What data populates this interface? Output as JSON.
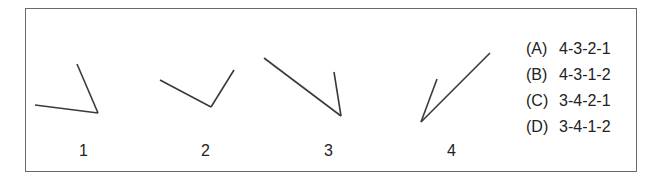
{
  "figures": [
    {
      "label": "1",
      "lines": [
        [
          35,
          105,
          98,
          113
        ],
        [
          98,
          113,
          77,
          64
        ]
      ]
    },
    {
      "label": "2",
      "lines": [
        [
          160,
          80,
          211,
          107
        ],
        [
          211,
          107,
          234,
          70
        ]
      ]
    },
    {
      "label": "3",
      "lines": [
        [
          264,
          58,
          341,
          116
        ],
        [
          341,
          116,
          334,
          72
        ]
      ]
    },
    {
      "label": "4",
      "lines": [
        [
          421,
          122,
          490,
          53
        ],
        [
          421,
          122,
          437,
          79
        ]
      ]
    }
  ],
  "options": [
    {
      "letter": "(A)",
      "value": "4-3-2-1"
    },
    {
      "letter": "(B)",
      "value": "4-3-1-2"
    },
    {
      "letter": "(C)",
      "value": "3-4-2-1"
    },
    {
      "letter": "(D)",
      "value": "3-4-1-2"
    }
  ],
  "colors": {
    "line": "#3a3a3a",
    "border": "#6a6a6a"
  }
}
